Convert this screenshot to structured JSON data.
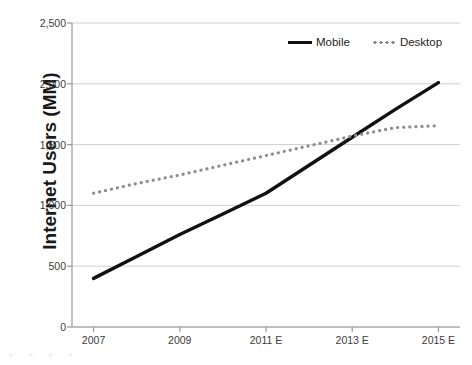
{
  "chart_data": {
    "type": "line",
    "title": "",
    "subtitle": "",
    "xlabel": "",
    "ylabel": "Internet Users (MM)",
    "x": [
      2007,
      2008,
      2009,
      2010,
      2011,
      2012,
      2013,
      2014,
      2015
    ],
    "x_tick_labels": [
      "2007",
      "2009",
      "2011 E",
      "2013 E",
      "2015 E"
    ],
    "x_tick_values": [
      2007,
      2009,
      2011,
      2013,
      2015
    ],
    "xlim": [
      2006.5,
      2015.5
    ],
    "ylim": [
      0,
      2500
    ],
    "y_tick_labels": [
      "0",
      "500",
      "1,000",
      "1,500",
      "2,000",
      "2,500"
    ],
    "y_tick_values": [
      0,
      500,
      1000,
      1500,
      2000,
      2500
    ],
    "grid": "horizontal",
    "legend_position": "top-center",
    "series": [
      {
        "name": "Mobile",
        "style": "solid",
        "color": "#111111",
        "values": [
          400,
          580,
          760,
          930,
          1100,
          1330,
          1560,
          1790,
          2010
        ]
      },
      {
        "name": "Desktop",
        "style": "dotted",
        "color": "#8d8d8d",
        "values": [
          1100,
          1180,
          1250,
          1330,
          1410,
          1490,
          1570,
          1640,
          1655
        ]
      }
    ]
  },
  "legend": {
    "entries": [
      {
        "label": "Mobile"
      },
      {
        "label": "Desktop"
      }
    ]
  },
  "axes": {
    "y_title": "Internet Users (MM)"
  },
  "colors": {
    "mobile": "#111111",
    "desktop": "#8d8d8d",
    "grid": "#cfcfcf",
    "axis": "#9a9a9a",
    "text": "#3b3b3b",
    "background": "#ffffff"
  }
}
